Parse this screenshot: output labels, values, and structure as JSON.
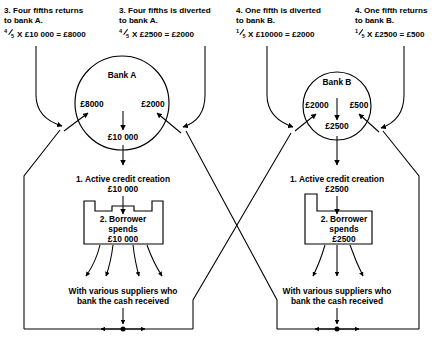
{
  "diagram": {
    "headings": [
      {
        "id": "h1",
        "line1": "3. Four fifths returns",
        "line2": "to bank A.",
        "frac_num": "4",
        "frac_den": "5",
        "equation": "X £10 000 = £8000"
      },
      {
        "id": "h2",
        "line1": "3. Four fifths is diverted",
        "line2": "to bank A.",
        "frac_num": "4",
        "frac_den": "5",
        "equation": "X £2500 = £2000"
      },
      {
        "id": "h3",
        "line1": "4. One fifth is diverted",
        "line2": "to bank B.",
        "frac_num": "1",
        "frac_den": "5",
        "equation": "X £10000 = £2000"
      },
      {
        "id": "h4",
        "line1": "4. One fifth returns",
        "line2": "to bank B.",
        "frac_num": "1",
        "frac_den": "5",
        "equation": "X £2500 = £500"
      }
    ],
    "bank_a": {
      "name": "Bank A",
      "left_amount": "£8000",
      "right_amount": "£2000",
      "total": "£10 000",
      "credit_line1": "1. Active credit creation",
      "credit_line2": "£10 000",
      "borrower_line1": "2. Borrower",
      "borrower_line2": "spends",
      "borrower_line3": "£10 000",
      "suppliers_line1": "With various suppliers who",
      "suppliers_line2": "bank the cash received"
    },
    "bank_b": {
      "name": "Bank B",
      "left_amount": "£2000",
      "right_amount": "£500",
      "total": "£2500",
      "credit_line1": "1. Active credit creation",
      "credit_line2": "£2500",
      "borrower_line1": "2. Borrower",
      "borrower_line2": "spends",
      "borrower_line3": "£2500",
      "suppliers_line1": "With various suppliers who",
      "suppliers_line2": "bank the cash received"
    },
    "colors": {
      "ink": "#000000",
      "background": "#ffffff"
    }
  }
}
